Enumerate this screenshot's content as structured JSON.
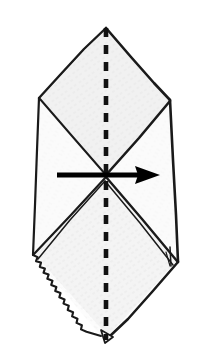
{
  "figure": {
    "background_color": "#ffffff",
    "ink_color": "#1a1a1a",
    "paper_fill": "#fdfdfd",
    "shade_fill": "#e8e8e8",
    "shade_fill_light": "#f2f2f2"
  },
  "geometry": {
    "canvas": {
      "width": 208,
      "height": 359
    },
    "outline_label": "paper-outline",
    "outline_points": "106,28 170,100 178,262 110,336 101,336 33,255 39,98",
    "top_left_slant": "39,98 106,28",
    "top_right_slant": "106,28 170,100",
    "left_edge": "39,98 33,255",
    "right_edge": "170,100 178,262",
    "bottom_left_edge": "33,255 101,336",
    "bottom_right_edge": "178,262 110,336",
    "upper_v_left": "40,99 106,175",
    "upper_v_right": "170,101 106,175",
    "lower_v_left": "106,177 34,254",
    "lower_v_right": "106,177 177,261",
    "lower_flap_left_inner": "104,180 38,258",
    "lower_flap_right_inner": "104,180 173,264",
    "right_flap_notch": "168,250 178,262 172,268",
    "bottom_tab": "101,330 112,336 104,341"
  },
  "fold_line": {
    "name": "valley-fold-dashed-centerline",
    "x": 106,
    "y_top": 28,
    "y_bottom": 338,
    "stroke_width": 4.6,
    "dash_pattern": "9 8",
    "color": "#111111"
  },
  "arrow": {
    "name": "fold-direction-arrow",
    "direction": "right",
    "shaft_start_x": 57,
    "shaft_end_x": 142,
    "y": 175,
    "tip_x": 160,
    "head_half_height": 9,
    "head_back_x": 138,
    "shaft_width": 5,
    "color": "#000000"
  },
  "serrated_edge": {
    "name": "torn-zigzag-edge",
    "from": "33,255",
    "to": "101,336",
    "teeth": 13,
    "amplitude": 3.6
  },
  "labels": {
    "none_visible": ""
  }
}
